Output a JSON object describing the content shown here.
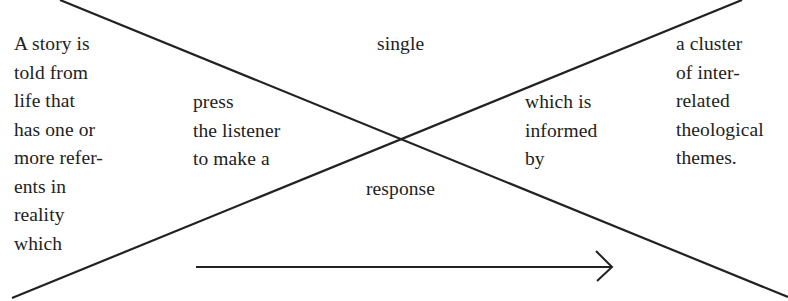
{
  "diagram": {
    "type": "crossing-lines",
    "colors": {
      "background": "#ffffff",
      "line": "#222222",
      "text": "#222222"
    },
    "left_block": {
      "lines": [
        "A story is",
        "told from",
        "life that",
        "has one or",
        "more refer-",
        "ents in",
        "reality",
        "which"
      ]
    },
    "center_left_block": {
      "lines": [
        "press",
        "the listener",
        "to make a"
      ]
    },
    "top_center_label": "single",
    "bottom_center_label": "response",
    "center_right_block": {
      "lines": [
        "which is",
        "informed",
        "by"
      ]
    },
    "right_block": {
      "lines": [
        "a cluster",
        "of inter-",
        "related",
        "theological",
        "themes."
      ]
    },
    "arrow": {
      "direction": "right"
    }
  }
}
